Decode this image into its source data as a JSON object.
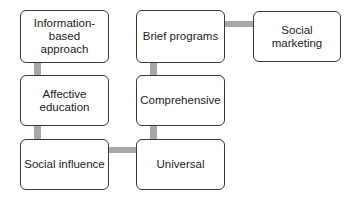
{
  "diagram": {
    "type": "flow",
    "connector_color": "#a8a8a8",
    "nodes": [
      {
        "id": "info",
        "label": "Information-\nbased approach"
      },
      {
        "id": "affective",
        "label": "Affective\neducation"
      },
      {
        "id": "social_influence",
        "label": "Social influence"
      },
      {
        "id": "universal",
        "label": "Universal"
      },
      {
        "id": "comprehensive",
        "label": "Comprehensive"
      },
      {
        "id": "brief",
        "label": "Brief programs"
      },
      {
        "id": "social_marketing",
        "label": "Social\nmarketing"
      }
    ],
    "edges": [
      {
        "from": "info",
        "to": "affective"
      },
      {
        "from": "affective",
        "to": "social_influence"
      },
      {
        "from": "social_influence",
        "to": "universal"
      },
      {
        "from": "universal",
        "to": "comprehensive"
      },
      {
        "from": "comprehensive",
        "to": "brief"
      },
      {
        "from": "brief",
        "to": "social_marketing"
      }
    ]
  }
}
